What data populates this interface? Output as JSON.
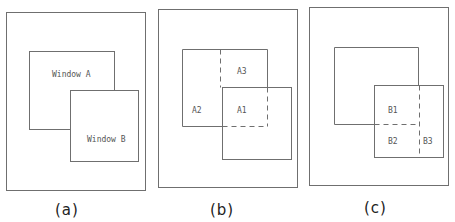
{
  "panels": [
    {
      "caption": "(a)",
      "labels": {
        "window_a": "Window A",
        "window_b": "Window B"
      }
    },
    {
      "caption": "(b)",
      "labels": {
        "a1": "A1",
        "a2": "A2",
        "a3": "A3"
      }
    },
    {
      "caption": "(c)",
      "labels": {
        "b1": "B1",
        "b2": "B2",
        "b3": "B3"
      }
    }
  ],
  "colors": {
    "line": "#6f6f6f",
    "label": "#555555",
    "caption": "#222222"
  }
}
